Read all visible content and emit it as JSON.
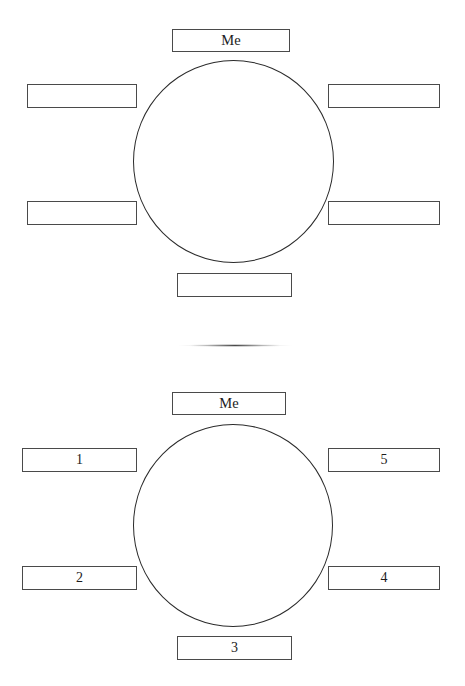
{
  "document": {
    "title": "Me Web Graphic Organizer",
    "background_color": "#ffffff",
    "line_color": "#2b2b2b"
  },
  "separator": {
    "name": "faded-horizontal-rule"
  },
  "diagrams": [
    {
      "id": "top",
      "center_label": "",
      "center_shape": "circle",
      "boxes": {
        "center_top": "Me",
        "left_upper": "",
        "right_upper": "",
        "left_lower": "",
        "right_lower": "",
        "center_bottom": ""
      }
    },
    {
      "id": "bottom",
      "center_label": "",
      "center_shape": "circle",
      "boxes": {
        "center_top": "Me",
        "left_upper": "1",
        "right_upper": "5",
        "left_lower": "2",
        "right_lower": "4",
        "center_bottom": "3"
      }
    }
  ]
}
